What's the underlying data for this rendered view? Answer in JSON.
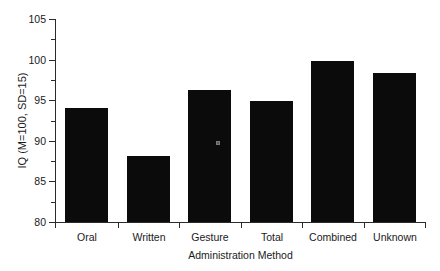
{
  "chart_data": {
    "type": "bar",
    "title": "",
    "subtitle": "",
    "xlabel": "Administration Method",
    "ylabel": "IQ (M=100, SD=15)",
    "categories": [
      "Oral",
      "Written",
      "Gesture",
      "Total",
      "Combined",
      "Unknown"
    ],
    "values": [
      94.0,
      88.1,
      96.2,
      94.9,
      99.8,
      98.4
    ],
    "series": [
      {
        "name": "Mean IQ",
        "values": [
          94.0,
          88.1,
          96.2,
          94.9,
          99.8,
          98.4
        ]
      }
    ],
    "ylim": [
      80,
      105
    ],
    "xlim": [
      0,
      6
    ],
    "y_major_ticks": [
      80,
      85,
      90,
      95,
      100,
      105
    ],
    "y_minor_ticks": [
      82.5,
      87.5,
      92.5,
      97.5,
      102.5
    ],
    "y_tick_labels": [
      "80",
      "85",
      "90",
      "95",
      "100",
      "105"
    ],
    "grid": false,
    "legend": "none",
    "bar_color": "#0b0b0b",
    "axis_color": "#2b2b2b",
    "background": "#ffffff",
    "annotations": [
      {
        "name": "scan-speck",
        "category": "Gesture",
        "note": "small light artifact inside Gesture bar"
      }
    ]
  },
  "axis": {
    "y_title": "IQ (M=100, SD=15)",
    "x_title": "Administration Method"
  }
}
